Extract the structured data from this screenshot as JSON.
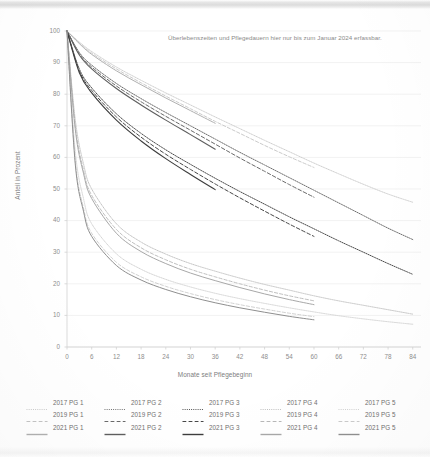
{
  "chart_data": {
    "type": "line",
    "title": "",
    "xlabel": "Monate seit Pflegebeginn",
    "ylabel": "Anteil in Prozent",
    "xlim": [
      0,
      86
    ],
    "ylim": [
      0,
      100
    ],
    "xticks": [
      0,
      6,
      12,
      18,
      24,
      30,
      36,
      42,
      48,
      54,
      60,
      66,
      72,
      78,
      84
    ],
    "yticks": [
      0,
      10,
      20,
      30,
      40,
      50,
      60,
      70,
      80,
      90,
      100
    ],
    "grid": "horizontal",
    "legend_position": "below",
    "annotations": [
      {
        "text": "Überlebenszeiten und Pflegedauern hier nur bis zum Januar 2024 erfassbar.",
        "x": 30,
        "y": 95
      }
    ],
    "series": [
      {
        "name": "2017 PG 1",
        "cohort": "2017",
        "group": "PG 1",
        "dash": "dotted",
        "color": "#c9c9c9",
        "width": 0.9,
        "x": [
          0,
          3,
          6,
          12,
          18,
          24,
          30,
          36,
          42,
          48,
          54,
          60,
          66,
          72,
          78,
          84
        ],
        "values": [
          100,
          96.5,
          93.5,
          88.6,
          84.4,
          80.4,
          76.6,
          72.8,
          69.1,
          65.4,
          61.8,
          58.2,
          54.8,
          51.5,
          48.4,
          45.8
        ]
      },
      {
        "name": "2017 PG 2",
        "cohort": "2017",
        "group": "PG 2",
        "dash": "dotted",
        "color": "#6e6e6e",
        "width": 1.0,
        "x": [
          0,
          3,
          6,
          12,
          18,
          24,
          30,
          36,
          42,
          48,
          54,
          60,
          66,
          72,
          78,
          84
        ],
        "values": [
          100,
          93.2,
          89.2,
          83.4,
          78.6,
          74.2,
          70.0,
          65.8,
          61.6,
          57.6,
          53.6,
          49.6,
          45.6,
          41.6,
          37.6,
          34.0
        ]
      },
      {
        "name": "2017 PG 3",
        "cohort": "2017",
        "group": "PG 3",
        "dash": "dotted",
        "color": "#4b4b4b",
        "width": 1.0,
        "x": [
          0,
          3,
          6,
          12,
          18,
          24,
          30,
          36,
          42,
          48,
          54,
          60,
          66,
          72,
          78,
          84
        ],
        "values": [
          100,
          88.0,
          82.0,
          73.8,
          67.6,
          62.4,
          57.8,
          53.4,
          49.2,
          45.2,
          41.2,
          37.4,
          33.6,
          30.0,
          26.4,
          23.0
        ]
      },
      {
        "name": "2017 PG 4",
        "cohort": "2017",
        "group": "PG 4",
        "dash": "dotted",
        "color": "#bdbdbd",
        "width": 0.9,
        "x": [
          0,
          2,
          4,
          6,
          12,
          18,
          24,
          30,
          36,
          42,
          48,
          54,
          60,
          66,
          72,
          78,
          84
        ],
        "values": [
          100,
          72.0,
          58.0,
          50.0,
          39.0,
          33.2,
          29.4,
          26.4,
          24.0,
          21.8,
          19.8,
          18.0,
          16.2,
          14.6,
          13.2,
          11.8,
          10.4
        ]
      },
      {
        "name": "2017 PG 5",
        "cohort": "2017",
        "group": "PG 5",
        "dash": "dotted",
        "color": "#cfcfcf",
        "width": 0.9,
        "x": [
          0,
          2,
          4,
          6,
          12,
          18,
          24,
          30,
          36,
          42,
          48,
          54,
          60,
          66,
          72,
          78,
          84
        ],
        "values": [
          100,
          62.0,
          47.0,
          39.0,
          29.5,
          24.6,
          21.4,
          19.0,
          17.0,
          15.3,
          13.8,
          12.4,
          11.1,
          9.9,
          8.9,
          8.0,
          7.2
        ]
      },
      {
        "name": "2019 PG 1",
        "cohort": "2019",
        "group": "PG 1",
        "dash": "dashed",
        "color": "#c4c4c4",
        "width": 0.9,
        "x": [
          0,
          3,
          6,
          12,
          18,
          24,
          30,
          36,
          42,
          48,
          54,
          60
        ],
        "values": [
          100,
          96.2,
          93.0,
          88.0,
          83.6,
          79.4,
          75.4,
          71.4,
          67.6,
          63.8,
          60.2,
          56.8
        ]
      },
      {
        "name": "2019 PG 2",
        "cohort": "2019",
        "group": "PG 2",
        "dash": "dashed",
        "color": "#6a6a6a",
        "width": 1.0,
        "x": [
          0,
          3,
          6,
          12,
          18,
          24,
          30,
          36,
          42,
          48,
          54,
          60
        ],
        "values": [
          100,
          92.8,
          88.6,
          82.6,
          77.6,
          73.0,
          68.6,
          64.2,
          59.8,
          55.6,
          51.4,
          47.4
        ]
      },
      {
        "name": "2019 PG 3",
        "cohort": "2019",
        "group": "PG 3",
        "dash": "dashed",
        "color": "#474747",
        "width": 1.0,
        "x": [
          0,
          3,
          6,
          12,
          18,
          24,
          30,
          36,
          42,
          48,
          54,
          60
        ],
        "values": [
          100,
          87.4,
          81.2,
          72.8,
          66.4,
          61.0,
          56.2,
          51.6,
          47.2,
          43.0,
          38.9,
          35.0
        ]
      },
      {
        "name": "2019 PG 4",
        "cohort": "2019",
        "group": "PG 4",
        "dash": "dashed",
        "color": "#b8b8b8",
        "width": 0.9,
        "x": [
          0,
          2,
          4,
          6,
          12,
          18,
          24,
          30,
          36,
          42,
          48,
          54,
          60
        ],
        "values": [
          100,
          70.0,
          56.0,
          48.0,
          37.2,
          31.4,
          27.6,
          24.6,
          22.2,
          20.0,
          18.0,
          16.2,
          14.6
        ]
      },
      {
        "name": "2019 PG 5",
        "cohort": "2019",
        "group": "PG 5",
        "dash": "dashed",
        "color": "#cbcbcb",
        "width": 0.9,
        "x": [
          0,
          2,
          4,
          6,
          12,
          18,
          24,
          30,
          36,
          42,
          48,
          54,
          60
        ],
        "values": [
          100,
          59.0,
          44.0,
          36.0,
          26.8,
          22.2,
          19.2,
          16.9,
          15.0,
          13.4,
          12.0,
          10.7,
          9.6
        ]
      },
      {
        "name": "2021 PG 1",
        "cohort": "2021",
        "group": "PG 1",
        "dash": "solid",
        "color": "#b0b0b0",
        "width": 1.0,
        "x": [
          0,
          3,
          6,
          12,
          18,
          24,
          30,
          36
        ],
        "values": [
          100,
          96.0,
          92.6,
          87.4,
          83.0,
          78.8,
          74.8,
          70.8
        ]
      },
      {
        "name": "2021 PG 2",
        "cohort": "2021",
        "group": "PG 2",
        "dash": "solid",
        "color": "#5e5e5e",
        "width": 1.1,
        "x": [
          0,
          3,
          6,
          12,
          18,
          24,
          30,
          36
        ],
        "values": [
          100,
          92.4,
          88.0,
          81.8,
          76.6,
          71.8,
          67.2,
          62.6
        ]
      },
      {
        "name": "2021 PG 3",
        "cohort": "2021",
        "group": "PG 3",
        "dash": "solid",
        "color": "#3d3d3d",
        "width": 1.1,
        "x": [
          0,
          3,
          6,
          12,
          18,
          24,
          30,
          36
        ],
        "values": [
          100,
          86.8,
          80.4,
          71.8,
          65.2,
          59.6,
          54.6,
          49.8
        ]
      },
      {
        "name": "2021 PG 4",
        "cohort": "2021",
        "group": "PG 4",
        "dash": "solid",
        "color": "#a8a8a8",
        "width": 1.0,
        "x": [
          0,
          2,
          4,
          6,
          12,
          18,
          24,
          30,
          36,
          42,
          48,
          54,
          60
        ],
        "values": [
          100,
          69.0,
          55.0,
          47.0,
          36.0,
          30.2,
          26.4,
          23.4,
          21.0,
          18.8,
          16.8,
          15.0,
          13.4
        ]
      },
      {
        "name": "2021 PG 5",
        "cohort": "2021",
        "group": "PG 5",
        "dash": "solid",
        "color": "#8f8f8f",
        "width": 1.0,
        "x": [
          0,
          2,
          4,
          6,
          12,
          18,
          24,
          30,
          36,
          42,
          48,
          54,
          60
        ],
        "values": [
          100,
          58.0,
          43.0,
          35.0,
          25.8,
          21.2,
          18.2,
          15.9,
          14.0,
          12.4,
          11.0,
          9.7,
          8.6
        ]
      }
    ]
  },
  "legend": {
    "rows": [
      {
        "cohort": "2017",
        "items": [
          {
            "label": "2017 PG 1",
            "color": "#c9c9c9",
            "dash": "dotted"
          },
          {
            "label": "2017 PG 2",
            "color": "#6e6e6e",
            "dash": "dotted"
          },
          {
            "label": "2017 PG 3",
            "color": "#4b4b4b",
            "dash": "dotted"
          },
          {
            "label": "2017 PG 4",
            "color": "#bdbdbd",
            "dash": "dotted"
          },
          {
            "label": "2017 PG 5",
            "color": "#cfcfcf",
            "dash": "dotted"
          }
        ]
      },
      {
        "cohort": "2019",
        "items": [
          {
            "label": "2019 PG 1",
            "color": "#c4c4c4",
            "dash": "dashed"
          },
          {
            "label": "2019 PG 2",
            "color": "#6a6a6a",
            "dash": "dashed"
          },
          {
            "label": "2019 PG 3",
            "color": "#474747",
            "dash": "dashed"
          },
          {
            "label": "2019 PG 4",
            "color": "#b8b8b8",
            "dash": "dashed"
          },
          {
            "label": "2019 PG 5",
            "color": "#cbcbcb",
            "dash": "dashed"
          }
        ]
      },
      {
        "cohort": "2021",
        "items": [
          {
            "label": "2021 PG 1",
            "color": "#b0b0b0",
            "dash": "solid"
          },
          {
            "label": "2021 PG 2",
            "color": "#5e5e5e",
            "dash": "solid"
          },
          {
            "label": "2021 PG 3",
            "color": "#3d3d3d",
            "dash": "solid"
          },
          {
            "label": "2021 PG 4",
            "color": "#a8a8a8",
            "dash": "solid"
          },
          {
            "label": "2021 PG 5",
            "color": "#8f8f8f",
            "dash": "solid"
          }
        ]
      }
    ]
  },
  "colors": {
    "grid": "#ededed",
    "axis": "#d2d2d2",
    "tick_text": "#8e8e8e",
    "axis_title": "#7c7c7c",
    "annotation": "#8a8a8a",
    "background": "#ffffff"
  }
}
